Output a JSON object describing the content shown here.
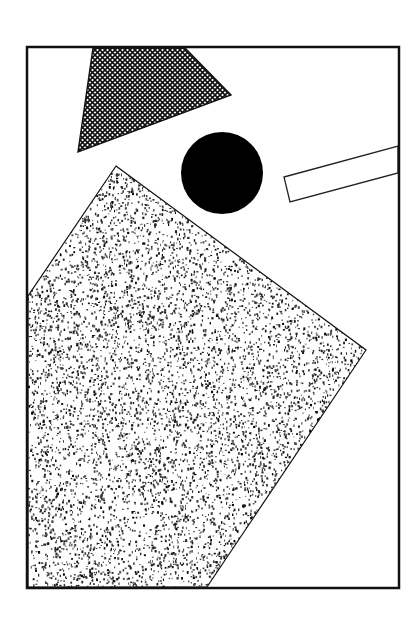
{
  "canvas": {
    "width": 420,
    "height": 623,
    "background": "#ffffff"
  },
  "colors": {
    "ink": "#111111",
    "paper": "#ffffff"
  },
  "frame": {
    "x": 27,
    "y": 47,
    "width": 372,
    "height": 541,
    "stroke_width": 2.5
  },
  "shapes": {
    "crosshatch_quad": {
      "points": [
        [
          93,
          48
        ],
        [
          185,
          48
        ],
        [
          231,
          95
        ],
        [
          78,
          152
        ]
      ],
      "fill_pattern": "crosshatch",
      "pattern_period": 5
    },
    "black_circle": {
      "cx": 222,
      "cy": 173,
      "r": 41,
      "fill": "#000000"
    },
    "outlined_bar": {
      "points": [
        [
          284,
          177
        ],
        [
          398,
          146
        ],
        [
          398,
          173
        ],
        [
          290,
          202
        ]
      ],
      "stroke_width": 1.3
    },
    "stippled_polygon": {
      "points": [
        [
          116,
          166
        ],
        [
          366,
          350
        ],
        [
          207,
          587
        ],
        [
          28,
          587
        ],
        [
          28,
          296
        ]
      ],
      "fill_pattern": "stipple",
      "speck_count": 9000,
      "seed": 7
    }
  }
}
